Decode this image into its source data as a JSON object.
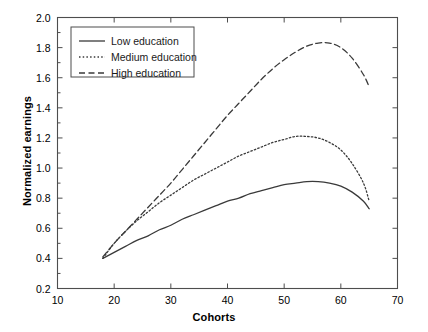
{
  "chart_data": {
    "type": "line",
    "title": "",
    "xlabel": "Cohorts",
    "ylabel": "Normalized earnings",
    "xlim": [
      10,
      70
    ],
    "ylim": [
      0.2,
      2.0
    ],
    "xticks": [
      "10",
      "20",
      "30",
      "40",
      "50",
      "60",
      "70"
    ],
    "yticks": [
      "0.2",
      "0.4",
      "0.6",
      "0.8",
      "1.0",
      "1.2",
      "1.4",
      "1.6",
      "1.8",
      "2.0"
    ],
    "xtick_values": [
      10,
      20,
      30,
      40,
      50,
      60,
      70
    ],
    "ytick_values": [
      0.2,
      0.4,
      0.6,
      0.8,
      1.0,
      1.2,
      1.4,
      1.6,
      1.8,
      2.0
    ],
    "grid": false,
    "legend_position": "upper-left",
    "series": [
      {
        "name": "Low education",
        "style": "solid",
        "color": "#3a3a3a",
        "x": [
          18,
          20,
          22,
          24,
          26,
          28,
          30,
          32,
          34,
          36,
          38,
          40,
          42,
          44,
          46,
          48,
          50,
          52,
          54,
          56,
          58,
          60,
          62,
          64,
          65
        ],
        "values": [
          0.4,
          0.44,
          0.48,
          0.52,
          0.55,
          0.59,
          0.62,
          0.66,
          0.69,
          0.72,
          0.75,
          0.78,
          0.8,
          0.83,
          0.85,
          0.87,
          0.89,
          0.9,
          0.91,
          0.91,
          0.9,
          0.88,
          0.84,
          0.78,
          0.73
        ]
      },
      {
        "name": "Medium education",
        "style": "dotted",
        "color": "#3a3a3a",
        "x": [
          18,
          20,
          22,
          24,
          26,
          28,
          30,
          32,
          34,
          36,
          38,
          40,
          42,
          44,
          46,
          48,
          50,
          52,
          54,
          56,
          58,
          60,
          62,
          64,
          65
        ],
        "values": [
          0.4,
          0.5,
          0.58,
          0.65,
          0.71,
          0.77,
          0.82,
          0.87,
          0.92,
          0.96,
          1.0,
          1.04,
          1.08,
          1.11,
          1.14,
          1.17,
          1.19,
          1.21,
          1.21,
          1.2,
          1.17,
          1.12,
          1.03,
          0.9,
          0.78
        ]
      },
      {
        "name": "High education",
        "style": "dashed",
        "color": "#3a3a3a",
        "x": [
          18,
          20,
          22,
          24,
          26,
          28,
          30,
          32,
          34,
          36,
          38,
          40,
          42,
          44,
          46,
          48,
          50,
          52,
          54,
          56,
          58,
          60,
          62,
          64,
          65
        ],
        "values": [
          0.41,
          0.5,
          0.58,
          0.66,
          0.74,
          0.82,
          0.9,
          0.99,
          1.08,
          1.17,
          1.26,
          1.35,
          1.43,
          1.51,
          1.59,
          1.66,
          1.72,
          1.77,
          1.81,
          1.83,
          1.83,
          1.8,
          1.73,
          1.62,
          1.54
        ]
      }
    ],
    "legend": [
      {
        "label": "Low education",
        "style": "solid"
      },
      {
        "label": "Medium education",
        "style": "dotted"
      },
      {
        "label": "High education",
        "style": "dashed"
      }
    ]
  }
}
